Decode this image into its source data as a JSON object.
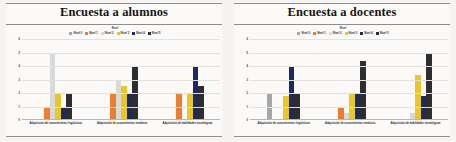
{
  "panels": [
    {
      "title": "Encuesta a alumnos",
      "legend_title": "Nivel",
      "legend": [
        {
          "label": "Nivel 0",
          "color": "#a6a6a6"
        },
        {
          "label": "Nivel 1",
          "color": "#ed7d31"
        },
        {
          "label": "Nivel 2",
          "color": "#d9d9d9"
        },
        {
          "label": "Nivel 3",
          "color": "#e8c72b"
        },
        {
          "label": "Nivel 4",
          "color": "#1b2a63"
        },
        {
          "label": "Nivel 5",
          "color": "#2e2e2e"
        }
      ],
      "categories": [
        "Adquisición de conocimientos lingüísticos",
        "Adquisición de conocimientos temáticos",
        "Adquisición de habilidades tecnológicas"
      ],
      "yticks": [
        "0",
        "1",
        "2",
        "3",
        "4",
        "5",
        "6"
      ]
    },
    {
      "title": "Encuesta a docentes",
      "legend_title": "Nivel",
      "legend": [
        {
          "label": "Nivel 0",
          "color": "#a6a6a6"
        },
        {
          "label": "Nivel 1",
          "color": "#ed7d31"
        },
        {
          "label": "Nivel 2",
          "color": "#d9d9d9"
        },
        {
          "label": "Nivel 3",
          "color": "#e8c72b"
        },
        {
          "label": "Nivel 4",
          "color": "#1b2a63"
        },
        {
          "label": "Nivel 5",
          "color": "#2e2e2e"
        }
      ],
      "categories": [
        "Adquisición de conocimientos lingüísticos",
        "Adquisición de conocimientos temáticos",
        "Adquisición de habilidades tecnológicas"
      ],
      "yticks": [
        "0",
        "1",
        "2",
        "3",
        "4",
        "5",
        "6"
      ]
    }
  ],
  "chart_data": [
    {
      "type": "bar",
      "title": "Encuesta a alumnos",
      "xlabel": "",
      "ylabel": "",
      "ylim": [
        0,
        6
      ],
      "grid": true,
      "legend_position": "top",
      "legend_title": "Nivel",
      "categories": [
        "Adquisición de conocimientos lingüísticos",
        "Adquisición de conocimientos temáticos",
        "Adquisición de habilidades tecnológicas"
      ],
      "series": [
        {
          "name": "Nivel 0",
          "color": "#a6a6a6",
          "values": [
            0,
            0,
            0
          ]
        },
        {
          "name": "Nivel 1",
          "color": "#ed7d31",
          "values": [
            1,
            2,
            2
          ]
        },
        {
          "name": "Nivel 2",
          "color": "#d9d9d9",
          "values": [
            5,
            3,
            0
          ]
        },
        {
          "name": "Nivel 3",
          "color": "#e8c72b",
          "values": [
            2,
            2.5,
            2
          ]
        },
        {
          "name": "Nivel 4",
          "color": "#1b2a63",
          "values": [
            1,
            2,
            4
          ]
        },
        {
          "name": "Nivel 5",
          "color": "#2e2e2e",
          "values": [
            2,
            4,
            2.5
          ]
        }
      ]
    },
    {
      "type": "bar",
      "title": "Encuesta a docentes",
      "xlabel": "",
      "ylabel": "",
      "ylim": [
        0,
        6
      ],
      "grid": true,
      "legend_position": "top",
      "legend_title": "Nivel",
      "categories": [
        "Adquisición de conocimientos lingüísticos",
        "Adquisición de conocimientos temáticos",
        "Adquisición de habilidades tecnológicas"
      ],
      "series": [
        {
          "name": "Nivel 0",
          "color": "#a6a6a6",
          "values": [
            2,
            0,
            0
          ]
        },
        {
          "name": "Nivel 1",
          "color": "#ed7d31",
          "values": [
            0,
            1,
            0
          ]
        },
        {
          "name": "Nivel 2",
          "color": "#d9d9d9",
          "values": [
            0,
            0.5,
            0.5
          ]
        },
        {
          "name": "Nivel 3",
          "color": "#e8c72b",
          "values": [
            1.8,
            2,
            3.3
          ]
        },
        {
          "name": "Nivel 4",
          "color": "#1b2a63",
          "values": [
            4,
            2,
            1.8
          ]
        },
        {
          "name": "Nivel 5",
          "color": "#2e2e2e",
          "values": [
            2,
            4.4,
            5
          ]
        }
      ]
    }
  ]
}
